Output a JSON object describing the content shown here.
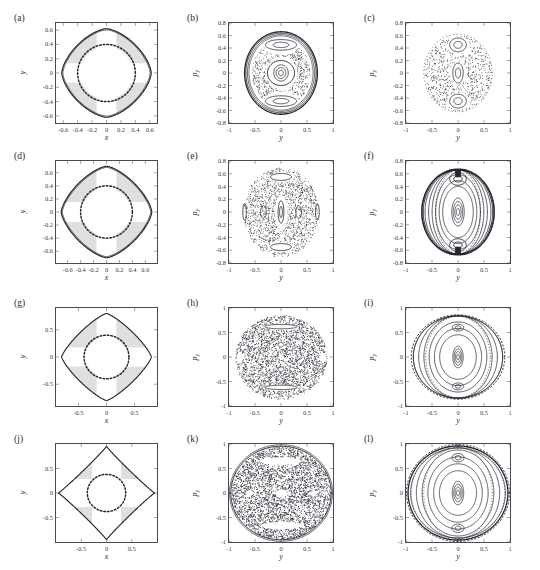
{
  "figure": {
    "title": "",
    "rows": 4,
    "cols": 3,
    "background": "#ffffff",
    "line_color": "#262630",
    "shade_color": "#d9d9d9",
    "axis_color": "#4a4a55"
  },
  "chart_data": [
    {
      "type": "line",
      "panel": "a",
      "tag": "(a)",
      "title": "",
      "xlabel": "x",
      "ylabel": "y",
      "xlim": [
        -0.7,
        0.7
      ],
      "ylim": [
        -0.7,
        0.7
      ],
      "xticks": [
        -0.6,
        -0.4,
        -0.2,
        0,
        0.2,
        0.4,
        0.6
      ],
      "xticklabels": [
        "-0.6",
        "-0.4",
        "-0.2",
        "0",
        "0.2",
        "0.4",
        "0.6"
      ],
      "yticks": [
        -0.6,
        -0.4,
        -0.2,
        0,
        0.2,
        0.4,
        0.6
      ],
      "yticklabels": [
        "-0.6",
        "-0.4",
        "-0.2",
        "0",
        "0.2",
        "0.4",
        "0.6"
      ],
      "grid": false,
      "legend": "none",
      "series": [
        {
          "name": "equipotential-boundary",
          "style": "solid",
          "amplitude": 0.62,
          "shape": "superellipse-diamond",
          "exponent": 1.55
        },
        {
          "name": "inner-orbit",
          "style": "dotted",
          "radius": 0.4,
          "shape": "rounded-circle"
        }
      ],
      "shaded_regions": "four-corner wedges between dotted circle and outer boundary"
    },
    {
      "type": "scatter",
      "panel": "b",
      "tag": "(b)",
      "title": "",
      "xlabel": "y",
      "ylabel": "p_y",
      "xlim": [
        -1,
        1
      ],
      "ylim": [
        -0.8,
        0.8
      ],
      "xticks": [
        -1,
        -0.5,
        0,
        0.5,
        1
      ],
      "xticklabels": [
        "-1",
        "-0.5",
        "0",
        "0.5",
        "1"
      ],
      "yticks": [
        -0.8,
        -0.6,
        -0.4,
        -0.2,
        0,
        0.2,
        0.4,
        0.6,
        0.8
      ],
      "yticklabels": [
        "-0.8",
        "-0.6",
        "-0.4",
        "-0.2",
        "0",
        "0.2",
        "0.4",
        "0.6",
        "0.8"
      ],
      "grid": false,
      "legend": "none",
      "features": [
        "outer invariant circle radius ~0.66",
        "central island",
        "two period-2 islands at p_y = ±0.45",
        "thin chaotic layer"
      ],
      "chaos_fraction": 0.18
    },
    {
      "type": "scatter",
      "panel": "c",
      "tag": "(c)",
      "title": "",
      "xlabel": "y",
      "ylabel": "p_y",
      "xlim": [
        -1,
        1
      ],
      "ylim": [
        -0.8,
        0.8
      ],
      "xticks": [
        -1,
        -0.5,
        0,
        0.5,
        1
      ],
      "xticklabels": [
        "-1",
        "-0.5",
        "0",
        "0.5",
        "1"
      ],
      "yticks": [
        -0.8,
        -0.6,
        -0.4,
        -0.2,
        0,
        0.2,
        0.4,
        0.6,
        0.8
      ],
      "yticklabels": [
        "-0.8",
        "-0.6",
        "-0.4",
        "-0.2",
        "0",
        "0.2",
        "0.4",
        "0.6",
        "0.8"
      ],
      "grid": false,
      "legend": "none",
      "features": [
        "sparse chaotic sea",
        "central island",
        "two islands at p_y = ±0.45"
      ],
      "chaos_fraction": 0.45
    },
    {
      "type": "line",
      "panel": "d",
      "tag": "(d)",
      "title": "",
      "xlabel": "x",
      "ylabel": "y",
      "xlim": [
        -0.78,
        0.78
      ],
      "ylim": [
        -0.78,
        0.78
      ],
      "xticks": [
        -0.6,
        -0.4,
        -0.2,
        0,
        0.2,
        0.4,
        0.6
      ],
      "xticklabels": [
        "-0.6",
        "-0.4",
        "-0.2",
        "0",
        "0.2",
        "0.4",
        "0.6"
      ],
      "yticks": [
        -0.6,
        -0.4,
        -0.2,
        0,
        0.2,
        0.4,
        0.6
      ],
      "yticklabels": [
        "-0.6",
        "-0.4",
        "-0.2",
        "0",
        "0.2",
        "0.4",
        "0.6"
      ],
      "grid": false,
      "legend": "none",
      "series": [
        {
          "name": "equipotential-boundary",
          "style": "solid",
          "amplitude": 0.7,
          "shape": "superellipse-diamond",
          "exponent": 1.45
        },
        {
          "name": "inner-orbit",
          "style": "dotted",
          "radius": 0.4,
          "shape": "rounded-circle"
        }
      ],
      "shaded_regions": "four-corner wedges"
    },
    {
      "type": "scatter",
      "panel": "e",
      "tag": "(e)",
      "title": "",
      "xlabel": "y",
      "ylabel": "p_y",
      "xlim": [
        -1,
        1
      ],
      "ylim": [
        -0.8,
        0.8
      ],
      "xticks": [
        -1,
        -0.5,
        0,
        0.5,
        1
      ],
      "xticklabels": [
        "-1",
        "-0.5",
        "0",
        "0.5",
        "1"
      ],
      "yticks": [
        -0.8,
        -0.6,
        -0.4,
        -0.2,
        0,
        0.2,
        0.4,
        0.6,
        0.8
      ],
      "yticklabels": [
        "-0.8",
        "-0.6",
        "-0.4",
        "-0.2",
        "0",
        "0.2",
        "0.4",
        "0.6",
        "0.8"
      ],
      "grid": false,
      "legend": "none",
      "features": [
        "dominant chaotic sea",
        "central vertical island",
        "islands at p_y = ±0.5",
        "side islands at y = ±0.7"
      ],
      "chaos_fraction": 0.8
    },
    {
      "type": "line",
      "panel": "f",
      "tag": "(f)",
      "title": "",
      "xlabel": "y",
      "ylabel": "p_y",
      "xlim": [
        -1,
        1
      ],
      "ylim": [
        -0.8,
        0.8
      ],
      "xticks": [
        -1,
        -0.5,
        0,
        0.5,
        1
      ],
      "xticklabels": [
        "-1",
        "-0.5",
        "0",
        "0.5",
        "1"
      ],
      "yticks": [
        -0.8,
        -0.6,
        -0.4,
        -0.2,
        0,
        0.2,
        0.4,
        0.6,
        0.8
      ],
      "yticklabels": [
        "-0.8",
        "-0.6",
        "-0.4",
        "-0.2",
        "0",
        "0.2",
        "0.4",
        "0.6",
        "0.8"
      ],
      "grid": false,
      "legend": "none",
      "features": [
        "nested regular tori",
        "central island chain",
        "dark islands at p_y = ±0.55"
      ],
      "chaos_fraction": 0.05
    },
    {
      "type": "line",
      "panel": "g",
      "tag": "(g)",
      "title": "",
      "xlabel": "x",
      "ylabel": "y",
      "xlim": [
        -0.9,
        0.9
      ],
      "ylim": [
        -0.9,
        0.9
      ],
      "xticks": [
        -0.5,
        0,
        0.5
      ],
      "xticklabels": [
        "-0.5",
        "0",
        "0.5"
      ],
      "yticks": [
        -0.5,
        0,
        0.5
      ],
      "yticklabels": [
        "-0.5",
        "0",
        "0.5"
      ],
      "grid": false,
      "legend": "none",
      "series": [
        {
          "name": "equipotential-boundary",
          "style": "solid",
          "amplitude": 0.8,
          "shape": "superellipse-diamond",
          "exponent": 1.25
        },
        {
          "name": "inner-orbit",
          "style": "dotted",
          "radius": 0.4,
          "shape": "rounded-circle"
        }
      ],
      "shaded_regions": "four-corner wedges"
    },
    {
      "type": "scatter",
      "panel": "h",
      "tag": "(h)",
      "title": "",
      "xlabel": "y",
      "ylabel": "p_y",
      "xlim": [
        -1,
        1
      ],
      "ylim": [
        -1,
        1
      ],
      "xticks": [
        -1,
        -0.5,
        0,
        0.5,
        1
      ],
      "xticklabels": [
        "-1",
        "-0.5",
        "0",
        "0.5",
        "1"
      ],
      "yticks": [
        -1,
        -0.5,
        0,
        0.5,
        1
      ],
      "yticklabels": [
        "-1",
        "-0.5",
        "0",
        "0.5",
        "1"
      ],
      "grid": false,
      "legend": "none",
      "features": [
        "fully developed chaotic sea",
        "thin regular islands at p_y = ±0.6",
        "side holes at y = ±0.8"
      ],
      "chaos_fraction": 0.93
    },
    {
      "type": "line",
      "panel": "i",
      "tag": "(i)",
      "title": "",
      "xlabel": "y",
      "ylabel": "p_y",
      "xlim": [
        -1,
        1
      ],
      "ylim": [
        -1,
        1
      ],
      "xticks": [
        -1,
        -0.5,
        0,
        0.5,
        1
      ],
      "xticklabels": [
        "-1",
        "-0.5",
        "0",
        "0.5",
        "1"
      ],
      "yticks": [
        -1,
        -0.5,
        0,
        0.5,
        1
      ],
      "yticklabels": [
        "-1",
        "-0.5",
        "0",
        "0.5",
        "1"
      ],
      "grid": false,
      "legend": "none",
      "features": [
        "nested regular tori",
        "central island chain",
        "small islands at p_y = ±0.58"
      ],
      "chaos_fraction": 0.06
    },
    {
      "type": "line",
      "panel": "j",
      "tag": "(j)",
      "title": "",
      "xlabel": "x",
      "ylabel": "y",
      "xlim": [
        -1,
        1
      ],
      "ylim": [
        -1,
        1
      ],
      "xticks": [
        -0.5,
        0,
        0.5
      ],
      "xticklabels": [
        "-0.5",
        "0",
        "0.5"
      ],
      "yticks": [
        -0.5,
        0,
        0.5
      ],
      "yticklabels": [
        "-0.5",
        "0",
        "0.5"
      ],
      "grid": false,
      "legend": "none",
      "series": [
        {
          "name": "equipotential-boundary",
          "style": "solid",
          "amplitude": 0.95,
          "shape": "superellipse-star",
          "exponent": 0.95
        },
        {
          "name": "inner-orbit",
          "style": "dotted",
          "radius": 0.38,
          "shape": "rounded-circle"
        }
      ],
      "shaded_regions": "four rectangular corner bands"
    },
    {
      "type": "scatter",
      "panel": "k",
      "tag": "(k)",
      "title": "",
      "xlabel": "y",
      "ylabel": "p_y",
      "xlim": [
        -1,
        1
      ],
      "ylim": [
        -1,
        1
      ],
      "xticks": [
        -1,
        -0.5,
        0,
        0.5,
        1
      ],
      "xticklabels": [
        "-1",
        "-0.5",
        "0",
        "0.5",
        "1"
      ],
      "yticks": [
        -1,
        -0.5,
        0,
        0.5,
        1
      ],
      "yticklabels": [
        "-1",
        "-0.5",
        "0",
        "0.5",
        "1"
      ],
      "grid": false,
      "legend": "none",
      "features": [
        "global chaos filling the energy shell",
        "small central hole",
        "crescent gaps at p_y = ±0.65"
      ],
      "chaos_fraction": 0.97
    },
    {
      "type": "line",
      "panel": "l",
      "tag": "(l)",
      "title": "",
      "xlabel": "y",
      "ylabel": "p_y",
      "xlim": [
        -1,
        1
      ],
      "ylim": [
        -1,
        1
      ],
      "xticks": [
        -1,
        -0.5,
        0,
        0.5,
        1
      ],
      "xticklabels": [
        "-1",
        "-0.5",
        "0",
        "0.5",
        "1"
      ],
      "yticks": [
        -1,
        -0.5,
        0,
        0.5,
        1
      ],
      "yticklabels": [
        "-1",
        "-0.5",
        "0",
        "0.5",
        "1"
      ],
      "grid": false,
      "legend": "none",
      "features": [
        "nested regular tori",
        "central island chain",
        "islands at p_y = ±0.72",
        "dotted outer separatrix"
      ],
      "chaos_fraction": 0.04
    }
  ]
}
